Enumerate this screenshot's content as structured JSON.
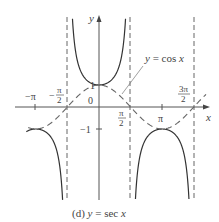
{
  "chart_data": {
    "type": "line",
    "title": "",
    "caption": "(d) y = sec x",
    "xlabel": "x",
    "ylabel": "y",
    "origin_label": "0",
    "x_ticks": [
      {
        "value": -3.14159,
        "label": "−π"
      },
      {
        "value": -1.5708,
        "label": "−π/2"
      },
      {
        "value": 1.5708,
        "label": "π/2"
      },
      {
        "value": 3.14159,
        "label": "π"
      },
      {
        "value": 4.71239,
        "label": "3π/2"
      }
    ],
    "y_ticks": [
      {
        "value": 1,
        "label": "1"
      },
      {
        "value": -1,
        "label": "−1"
      }
    ],
    "asymptotes_x": [
      -1.5708,
      1.5708,
      4.71239
    ],
    "series": [
      {
        "name": "y = sec x",
        "style": "solid",
        "function": "sec"
      },
      {
        "name": "y = cos x",
        "style": "dashed",
        "function": "cos"
      }
    ],
    "annotation": {
      "text": "y = cos x",
      "points_to": "cosine curve"
    },
    "xlim": [
      -3.4,
      5.1
    ],
    "ylim": [
      -4,
      4
    ],
    "grid": false,
    "legend": "none"
  },
  "labels": {
    "caption_prefix": "(d) ",
    "caption_y": "y",
    "caption_eq": " = sec ",
    "caption_x": "x",
    "axis_x": "x",
    "axis_y": "y",
    "origin": "0",
    "tick_one": "1",
    "tick_neg_one": "−1",
    "annot_y": "y",
    "annot_eq": " = cos ",
    "annot_x": "x",
    "neg_pi": "−π",
    "neg_pi_2_num": "π",
    "neg_pi_2_den": "2",
    "neg_sign": "−",
    "pi_2_num": "π",
    "pi_2_den": "2",
    "pi": "π",
    "three_pi_2_num": "3π",
    "three_pi_2_den": "2"
  }
}
